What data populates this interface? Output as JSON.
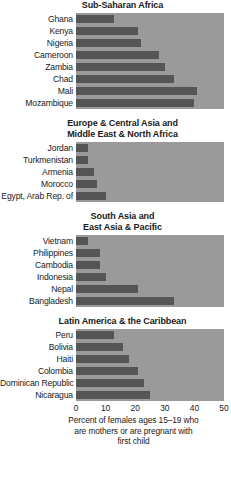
{
  "chart_data": {
    "type": "bar",
    "orientation": "horizontal",
    "title": "",
    "xlabel": "Percent of females ages 15–19 who are mothers or are pregnant with first child",
    "ylabel": "",
    "xlim": [
      0,
      50
    ],
    "xticks": [
      0,
      10,
      20,
      30,
      40,
      50
    ],
    "xtick_labels": [
      "0",
      "10",
      "20",
      "30",
      "40",
      "50"
    ],
    "grid": true,
    "legend": false,
    "colors": {
      "bar": "#555555",
      "panel_background": "#9a9a9a",
      "gridline": "#ffffff",
      "text": "#1a1a1a",
      "page_background": "#ffffff"
    },
    "panels": [
      {
        "title": "Sub-Saharan Africa",
        "categories": [
          "Ghana",
          "Kenya",
          "Nigeria",
          "Cameroon",
          "Zambia",
          "Chad",
          "Mali",
          "Mozambique"
        ],
        "values": [
          13,
          21,
          22,
          28,
          30,
          33,
          41,
          40
        ]
      },
      {
        "title": "Europe & Central Asia and\nMiddle East & North Africa",
        "categories": [
          "Jordan",
          "Turkmenistan",
          "Armenia",
          "Morocco",
          "Egypt, Arab Rep. of"
        ],
        "values": [
          4,
          4,
          6,
          7,
          10
        ]
      },
      {
        "title": "South Asia and\nEast Asia & Pacific",
        "categories": [
          "Vietnam",
          "Philippines",
          "Cambodia",
          "Indonesia",
          "Nepal",
          "Bangladesh"
        ],
        "values": [
          4,
          8,
          8,
          10,
          21,
          33
        ]
      },
      {
        "title": "Latin America & the Caribbean",
        "categories": [
          "Peru",
          "Bolivia",
          "Haiti",
          "Colombia",
          "Dominican Republic",
          "Nicaragua"
        ],
        "values": [
          13,
          16,
          18,
          21,
          23,
          25
        ]
      }
    ],
    "axis_caption_lines": [
      "Percent of females ages 15–19 who",
      "are mothers or are pregnant with",
      "first child"
    ]
  }
}
